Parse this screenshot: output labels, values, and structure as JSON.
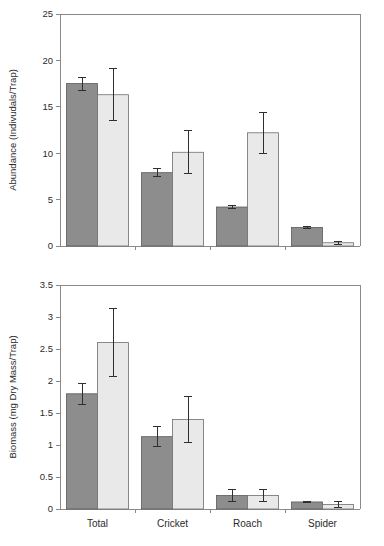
{
  "figure": {
    "title": "",
    "background": "#ffffff",
    "series_colors": {
      "dark": "#8d8d8d",
      "light": "#e9e9e9"
    }
  },
  "chart_data": [
    {
      "id": "abundance",
      "type": "bar",
      "title": "",
      "xlabel": "",
      "ylabel": "Abundance (Indivudals/Trap)",
      "categories": [
        "Total",
        "Cricket",
        "Roach",
        "Spider"
      ],
      "ylim": [
        0,
        25
      ],
      "yticks": [
        0,
        5,
        10,
        15,
        20,
        25
      ],
      "ytick_labels": [
        "0",
        "5",
        "10",
        "15",
        "20",
        "25"
      ],
      "grid": false,
      "legend": "none",
      "series": [
        {
          "name": "dark",
          "color": "#8d8d8d",
          "values": [
            17.5,
            7.9,
            4.2,
            2.0
          ],
          "errors": [
            0.7,
            0.45,
            0.12,
            0.12
          ]
        },
        {
          "name": "light",
          "color": "#e9e9e9",
          "values": [
            16.3,
            10.1,
            12.2,
            0.35
          ],
          "errors": [
            2.8,
            2.3,
            2.2,
            0.15
          ]
        }
      ]
    },
    {
      "id": "biomass",
      "type": "bar",
      "title": "",
      "xlabel": "",
      "ylabel": "Biomass (mg Dry Mass/Trap)",
      "categories": [
        "Total",
        "Cricket",
        "Roach",
        "Spider"
      ],
      "ylim": [
        0,
        3.5
      ],
      "yticks": [
        0,
        0.5,
        1,
        1.5,
        2,
        2.5,
        3,
        3.5
      ],
      "ytick_labels": [
        "0",
        "0.5",
        "1",
        "1.5",
        "2",
        "2.5",
        "3",
        "3.5"
      ],
      "grid": false,
      "legend": "none",
      "series": [
        {
          "name": "dark",
          "color": "#8d8d8d",
          "values": [
            1.8,
            1.13,
            0.21,
            0.11
          ],
          "errors": [
            0.16,
            0.155,
            0.1,
            0.015
          ]
        },
        {
          "name": "light",
          "color": "#e9e9e9",
          "values": [
            2.6,
            1.4,
            0.21,
            0.07
          ],
          "errors": [
            0.53,
            0.355,
            0.095,
            0.04
          ]
        }
      ]
    }
  ]
}
